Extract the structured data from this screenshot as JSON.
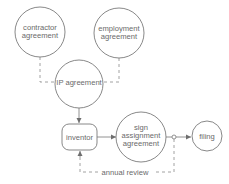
{
  "diagram": {
    "nodes": [
      {
        "id": "contractor",
        "shape": "circle",
        "lines": [
          "contractor",
          "agreement"
        ]
      },
      {
        "id": "employment",
        "shape": "circle",
        "lines": [
          "employment",
          "agreement"
        ]
      },
      {
        "id": "ip",
        "shape": "circle",
        "lines": [
          "IP agreement"
        ]
      },
      {
        "id": "inventor",
        "shape": "rounded-rect",
        "lines": [
          "inventor"
        ]
      },
      {
        "id": "sign",
        "shape": "circle",
        "lines": [
          "sign",
          "assignment",
          "agreement"
        ]
      },
      {
        "id": "filing",
        "shape": "circle",
        "lines": [
          "filing"
        ]
      }
    ],
    "edges": [
      {
        "from": "contractor",
        "to": "ip",
        "style": "dashed",
        "arrow": false
      },
      {
        "from": "employment",
        "to": "ip",
        "style": "dashed",
        "arrow": false
      },
      {
        "from": "ip",
        "to": "inventor",
        "style": "solid",
        "arrow": true
      },
      {
        "from": "inventor",
        "to": "sign",
        "style": "solid",
        "arrow": true
      },
      {
        "from": "sign",
        "to": "filing",
        "style": "solid",
        "arrow": true,
        "junction": "open-circle"
      },
      {
        "from": "junction",
        "to": "inventor",
        "style": "dashed",
        "arrow": true,
        "label": "annual review"
      }
    ],
    "colors": {
      "stroke": "#7a7a7a",
      "text": "#6a6a6a",
      "background": "#ffffff"
    }
  }
}
